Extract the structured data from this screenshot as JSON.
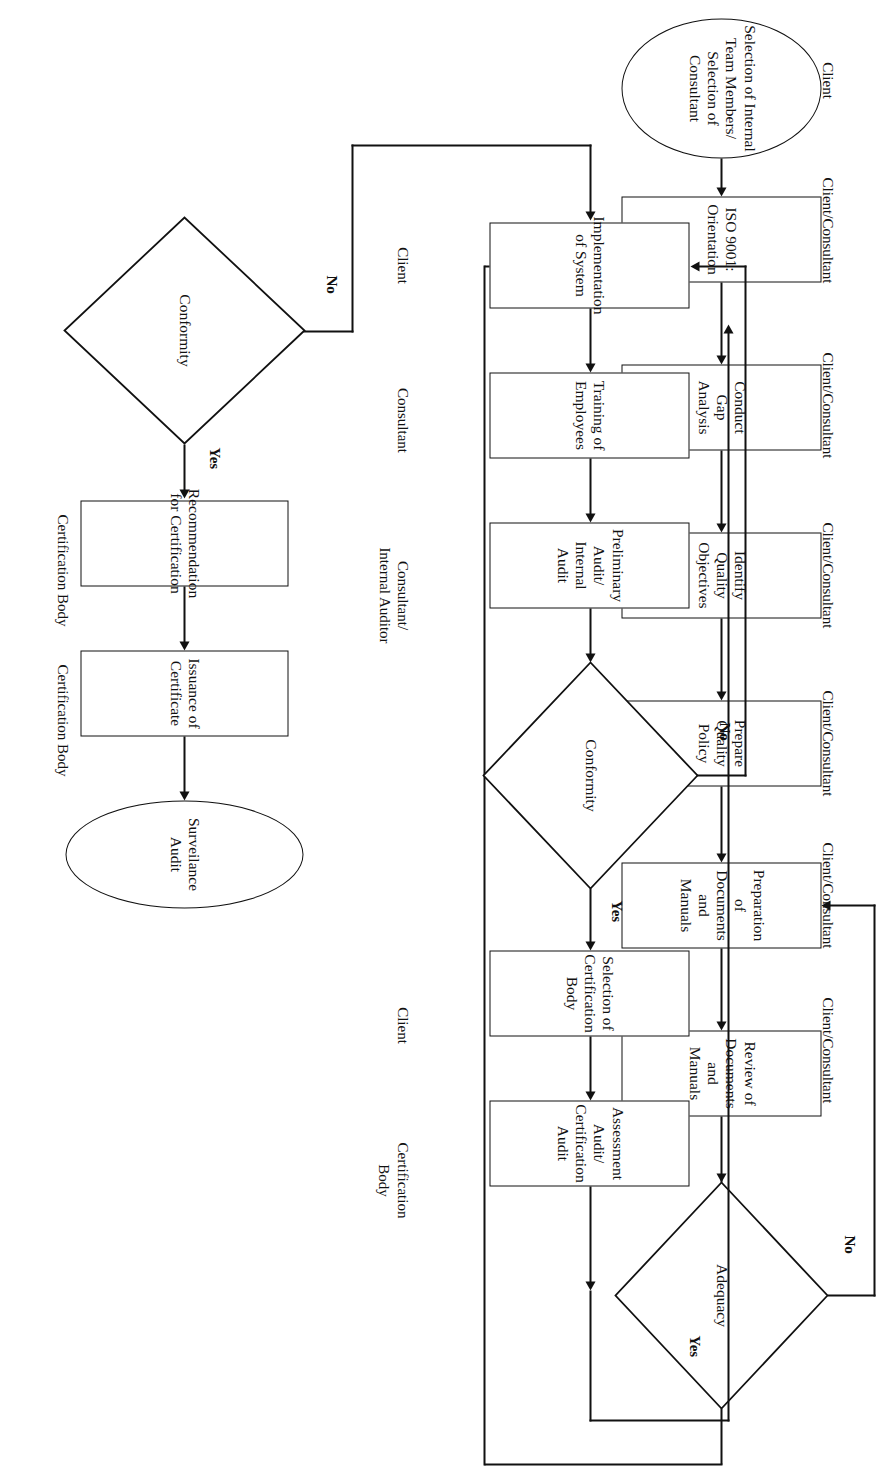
{
  "diagram": {
    "type": "flowchart",
    "orientation": "rotated-90-clockwise"
  },
  "rows": {
    "row1": {
      "roles": [
        {
          "id": "role-r1-start",
          "text": "Client"
        },
        {
          "id": "role-r1-1",
          "text": "Client/Consultant"
        },
        {
          "id": "role-r1-2",
          "text": "Client/Consultant"
        },
        {
          "id": "role-r1-3",
          "text": "Client/Consultant"
        },
        {
          "id": "role-r1-4",
          "text": "Client/Consultant"
        },
        {
          "id": "role-r1-5",
          "text": "Client/Consultant"
        },
        {
          "id": "role-r1-6",
          "text": "Client/Consultant"
        }
      ],
      "nodes": [
        {
          "id": "n-start",
          "shape": "ellipse",
          "text": "Selection of Internal Team Members/ Selection of Consultant"
        },
        {
          "id": "n-iso",
          "shape": "process",
          "text": "ISO 9001: Orientation"
        },
        {
          "id": "n-gap",
          "shape": "process",
          "text": "Conduct Gap Analysis"
        },
        {
          "id": "n-obj",
          "shape": "process",
          "text": "Identify Quality Objectives"
        },
        {
          "id": "n-policy",
          "shape": "process",
          "text": "Prepare Quality Policy"
        },
        {
          "id": "n-prep",
          "shape": "process",
          "text": "Preparation of Documents and Manuals"
        },
        {
          "id": "n-review",
          "shape": "process",
          "text": "Review of Documents and Manuals"
        },
        {
          "id": "n-adequacy",
          "shape": "decision",
          "text": "Adequacy"
        }
      ],
      "branch_yes": "Yes",
      "branch_no": "No"
    },
    "row2": {
      "roles": [
        {
          "id": "role-r2-1",
          "text": "Client"
        },
        {
          "id": "role-r2-2",
          "text": "Consultant"
        },
        {
          "id": "role-r2-3",
          "text": "Consultant/\nInternal Auditor"
        },
        {
          "id": "role-r2-4",
          "text": "Client"
        },
        {
          "id": "role-r2-5",
          "text": "Certification Body"
        }
      ],
      "nodes": [
        {
          "id": "n-impl",
          "shape": "process",
          "text": "Implementation of System"
        },
        {
          "id": "n-train",
          "shape": "process",
          "text": "Training of Employees"
        },
        {
          "id": "n-prelim",
          "shape": "process",
          "text": "Preliminary Audit/ Internal Audit"
        },
        {
          "id": "n-conf1",
          "shape": "decision",
          "text": "Conformity"
        },
        {
          "id": "n-selcb",
          "shape": "process",
          "text": "Selection of Certification Body"
        },
        {
          "id": "n-assess",
          "shape": "process",
          "text": "Assessment Audit/ Certification Audit"
        }
      ],
      "branch_yes": "Yes",
      "branch_no": "No"
    },
    "row3": {
      "roles": [
        {
          "id": "role-r3-1",
          "text": "Certification Body"
        },
        {
          "id": "role-r3-2",
          "text": "Certification Body"
        }
      ],
      "nodes": [
        {
          "id": "n-conf2",
          "shape": "decision",
          "text": "Conformity"
        },
        {
          "id": "n-recom",
          "shape": "process",
          "text": "Recommendation for Certification"
        },
        {
          "id": "n-issue",
          "shape": "process",
          "text": "Issuance of Certificate"
        },
        {
          "id": "n-surv",
          "shape": "ellipse",
          "text": "Surveilance Audit"
        }
      ],
      "branch_yes": "Yes",
      "branch_no": "No"
    }
  },
  "colors": {
    "stroke": "#111111",
    "background": "#ffffff"
  }
}
